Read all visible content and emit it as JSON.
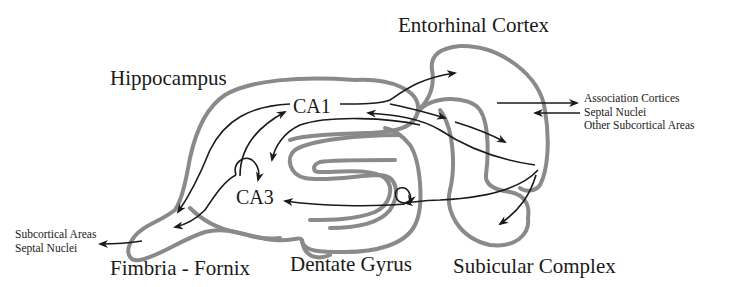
{
  "diagram": {
    "type": "anatomical-circuit",
    "outline_color": "#8a8a8a",
    "arrow_color": "#1a1a1a",
    "background": "#ffffff",
    "labels": {
      "entorhinal_cortex": "Entorhinal Cortex",
      "hippocampus": "Hippocampus",
      "ca1": "CA1",
      "ca3": "CA3",
      "fimbria_fornix": "Fimbria - Fornix",
      "dentate_gyrus": "Dentate Gyrus",
      "subicular_complex": "Subicular Complex"
    },
    "external_targets_right": [
      "Association Cortices",
      "Septal Nuclei",
      "Other Subcortical Areas"
    ],
    "external_targets_left": [
      "Subcortical Areas",
      "Septal Nuclei"
    ],
    "connections": [
      {
        "from": "CA1",
        "to": "Entorhinal Cortex"
      },
      {
        "from": "CA1",
        "to": "Subicular Complex"
      },
      {
        "from": "Entorhinal Cortex",
        "to": "CA1"
      },
      {
        "from": "Entorhinal Cortex",
        "to": "CA3"
      },
      {
        "from": "Entorhinal Cortex",
        "to": "Dentate Gyrus"
      },
      {
        "from": "Entorhinal Cortex",
        "to": "Subicular Complex"
      },
      {
        "from": "Dentate Gyrus",
        "to": "CA3"
      },
      {
        "from": "Dentate Gyrus",
        "to": "Dentate Gyrus"
      },
      {
        "from": "CA3",
        "to": "CA1"
      },
      {
        "from": "CA3",
        "to": "CA3"
      },
      {
        "from": "CA1",
        "to": "Fimbria - Fornix"
      },
      {
        "from": "CA3",
        "to": "Fimbria - Fornix"
      },
      {
        "from": "Fimbria - Fornix",
        "to": "Subcortical Areas / Septal Nuclei"
      },
      {
        "from": "Entorhinal Cortex",
        "to": "Association Cortices / Septal Nuclei / Other Subcortical Areas"
      },
      {
        "from": "Association Cortices / Septal Nuclei / Other Subcortical Areas",
        "to": "Entorhinal Cortex"
      }
    ]
  }
}
